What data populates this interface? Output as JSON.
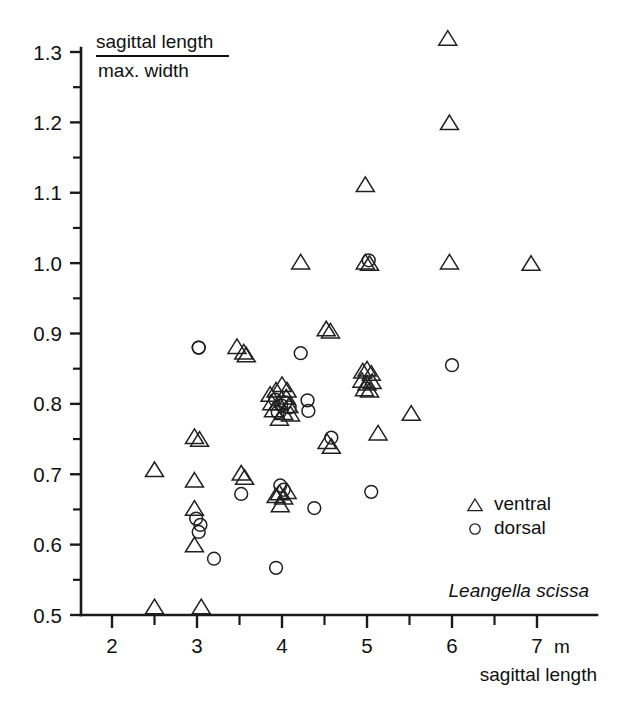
{
  "chart_data": {
    "type": "scatter",
    "title": "",
    "annotation_species": "Leangella  scissa",
    "xlabel": "sagittal length",
    "xunit": "m",
    "ylabel_numerator": "sagittal length",
    "ylabel_denominator": "max. width",
    "xlim": [
      1.7,
      7.55
    ],
    "ylim": [
      0.5,
      1.34
    ],
    "xticks": [
      2,
      3,
      4,
      5,
      6,
      7
    ],
    "xticklabels": [
      "2",
      "3",
      "4",
      "5",
      "6",
      "7"
    ],
    "xminorticks": [
      2.5,
      3.5,
      4.5,
      5.5,
      6.5
    ],
    "yticks": [
      0.5,
      0.6,
      0.7,
      0.8,
      0.9,
      1.0,
      1.1,
      1.2,
      1.3
    ],
    "yticklabels": [
      "0.5",
      "0.6",
      "0.7",
      "0.8",
      "0.9",
      "1.0",
      "1.1",
      "1.2",
      "1.3"
    ],
    "yminorticks": [
      0.55,
      0.65,
      0.75,
      0.85,
      0.95,
      1.05,
      1.15,
      1.25
    ],
    "grid": false,
    "legend_position": "lower-right",
    "series": [
      {
        "name": "ventral",
        "marker": "triangle",
        "points": [
          [
            2.5,
            0.705
          ],
          [
            2.5,
            0.51
          ],
          [
            2.97,
            0.752
          ],
          [
            3.03,
            0.748
          ],
          [
            3.05,
            0.51
          ],
          [
            2.97,
            0.69
          ],
          [
            2.97,
            0.65
          ],
          [
            2.97,
            0.598
          ],
          [
            3.47,
            0.88
          ],
          [
            3.55,
            0.872
          ],
          [
            3.58,
            0.868
          ],
          [
            3.52,
            0.7
          ],
          [
            3.56,
            0.694
          ],
          [
            3.93,
            0.818
          ],
          [
            3.86,
            0.812
          ],
          [
            4.0,
            0.826
          ],
          [
            3.96,
            0.8
          ],
          [
            4.05,
            0.808
          ],
          [
            4.08,
            0.796
          ],
          [
            3.9,
            0.79
          ],
          [
            4.02,
            0.786
          ],
          [
            3.97,
            0.778
          ],
          [
            4.1,
            0.784
          ],
          [
            3.88,
            0.8
          ],
          [
            4.06,
            0.818
          ],
          [
            3.97,
            0.672
          ],
          [
            4.02,
            0.666
          ],
          [
            4.06,
            0.674
          ],
          [
            3.98,
            0.655
          ],
          [
            3.93,
            0.668
          ],
          [
            4.22,
            1.0
          ],
          [
            4.52,
            0.905
          ],
          [
            4.57,
            0.902
          ],
          [
            4.53,
            0.745
          ],
          [
            4.58,
            0.738
          ],
          [
            4.95,
            0.845
          ],
          [
            5.0,
            0.848
          ],
          [
            5.05,
            0.842
          ],
          [
            4.94,
            0.832
          ],
          [
            5.0,
            0.828
          ],
          [
            5.06,
            0.83
          ],
          [
            4.97,
            0.82
          ],
          [
            5.03,
            0.818
          ],
          [
            4.98,
            1.0
          ],
          [
            5.03,
            0.998
          ],
          [
            4.98,
            1.11
          ],
          [
            5.13,
            0.757
          ],
          [
            5.52,
            0.785
          ],
          [
            5.95,
            1.318
          ],
          [
            5.97,
            1.198
          ],
          [
            5.97,
            1.0
          ],
          [
            6.93,
            0.998
          ]
        ]
      },
      {
        "name": "dorsal",
        "marker": "circle",
        "points": [
          [
            3.02,
            0.88
          ],
          [
            2.99,
            0.637
          ],
          [
            3.04,
            0.628
          ],
          [
            3.02,
            0.618
          ],
          [
            3.2,
            0.58
          ],
          [
            3.52,
            0.672
          ],
          [
            3.93,
            0.567
          ],
          [
            3.98,
            0.684
          ],
          [
            4.02,
            0.678
          ],
          [
            3.92,
            0.806
          ],
          [
            3.99,
            0.798
          ],
          [
            4.04,
            0.802
          ],
          [
            4.09,
            0.795
          ],
          [
            3.95,
            0.788
          ],
          [
            4.22,
            0.872
          ],
          [
            4.3,
            0.805
          ],
          [
            4.31,
            0.79
          ],
          [
            4.38,
            0.652
          ],
          [
            4.58,
            0.752
          ],
          [
            5.02,
            1.004
          ],
          [
            5.05,
            0.675
          ],
          [
            6.0,
            0.855
          ],
          [
            3.02,
            0.88
          ]
        ]
      }
    ]
  },
  "legend": {
    "items": [
      {
        "label": "ventral",
        "marker": "triangle"
      },
      {
        "label": "dorsal",
        "marker": "circle"
      }
    ]
  }
}
